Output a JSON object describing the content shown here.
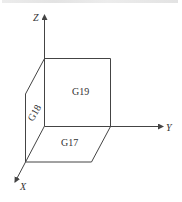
{
  "axes": {
    "z": "Z",
    "y": "Y",
    "x": "X"
  },
  "planes": {
    "xy": "G17",
    "yz": "G19",
    "zx": "G18"
  },
  "colors": {
    "line": "#444444",
    "text": "#333333"
  }
}
